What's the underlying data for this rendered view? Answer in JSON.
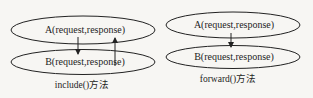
{
  "diagrams": [
    {
      "id": "include",
      "node_a": "A(request,response)",
      "node_b": "B(request,response)",
      "caption": "include()方法",
      "arrows": [
        "A→B",
        "B→A"
      ]
    },
    {
      "id": "forward",
      "node_a": "A(request,response)",
      "node_b": "B(request,response)",
      "caption": "forward()方法",
      "arrows": [
        "A→B"
      ]
    }
  ],
  "colors": {
    "background": "#f7f6f3",
    "stroke": "#222222",
    "text": "#1e1e1e"
  }
}
